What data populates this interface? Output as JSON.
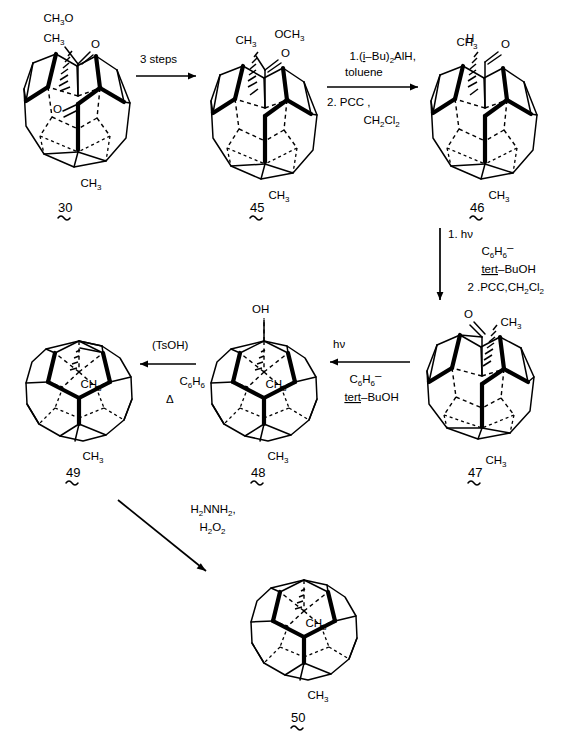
{
  "scheme": {
    "title": "Dodecahedrane synthesis reaction scheme",
    "compounds": [
      {
        "id": "30",
        "number": "30",
        "top_label_a": "CH",
        "top_label_a_sub": "3",
        "top_label_a_tail": "O",
        "top_label_b": "CH",
        "top_label_b_sub": "3",
        "carbonyl_o": "O",
        "internal_o": "O",
        "bottom_label": "CH",
        "bottom_label_sub": "3"
      },
      {
        "id": "45",
        "number": "45",
        "top_label_a": "CH",
        "top_label_a_sub": "3",
        "top_label_b": "OCH",
        "top_label_b_sub": "3",
        "carbonyl_o": "O",
        "bottom_label": "CH",
        "bottom_label_sub": "3"
      },
      {
        "id": "46",
        "number": "46",
        "top_label_a": "CH",
        "top_label_a_sub": "3",
        "top_label_h": "H",
        "carbonyl_o": "O",
        "bottom_label": "CH",
        "bottom_label_sub": "3"
      },
      {
        "id": "47",
        "number": "47",
        "carbonyl_o": "O",
        "top_label_a": "CH",
        "top_label_a_sub": "3",
        "bottom_label": "CH",
        "bottom_label_sub": "3"
      },
      {
        "id": "48",
        "number": "48",
        "top_label": "OH",
        "inner_label": "CH",
        "inner_label_sub": "3",
        "bottom_label": "CH",
        "bottom_label_sub": "3"
      },
      {
        "id": "49",
        "number": "49",
        "inner_label": "CH",
        "inner_label_sub": "3",
        "bottom_label": "CH",
        "bottom_label_sub": "3"
      },
      {
        "id": "50",
        "number": "50",
        "inner_label": "CH",
        "inner_label_sub": "3",
        "bottom_label": "CH",
        "bottom_label_sub": "3"
      }
    ],
    "arrows": [
      {
        "name": "arrow-30-to-45",
        "direction": "right",
        "above": "3 steps",
        "below": ""
      },
      {
        "name": "arrow-45-to-46",
        "direction": "right",
        "line1_a": "1.(",
        "line1_i": "i",
        "line1_b": "–Bu)",
        "line1_sub": "2",
        "line1_c": "AlH,",
        "line2": "toluene",
        "line3": "2. PCC ,",
        "line4_a": "CH",
        "line4_sub1": "2",
        "line4_b": "Cl",
        "line4_sub2": "2"
      },
      {
        "name": "arrow-46-to-47",
        "direction": "down",
        "line1": "1. hν",
        "line2_a": "C",
        "line2_sub1": "6",
        "line2_b": "H",
        "line2_sub2": "6",
        "line2_c": "–",
        "line3_a": "tert",
        "line3_b": "–BuOH",
        "line4_a": "2 .PCC,CH",
        "line4_sub1": "2",
        "line4_b": "Cl",
        "line4_sub2": "2"
      },
      {
        "name": "arrow-47-to-48",
        "direction": "left",
        "above": "hν",
        "below_a": "C",
        "below_sub1": "6",
        "below_b": "H",
        "below_sub2": "6",
        "below_c": "–",
        "below_line2_a": "tert",
        "below_line2_b": "–BuOH"
      },
      {
        "name": "arrow-48-to-49",
        "direction": "left",
        "above": "(TsOH)",
        "below_a": "C",
        "below_sub1": "6",
        "below_b": "H",
        "below_sub2": "6",
        "below_line2": "Δ"
      },
      {
        "name": "arrow-49-to-50",
        "direction": "diagonal-down-right",
        "line1_a": "H",
        "line1_sub1": "2",
        "line1_b": "NNH",
        "line1_sub2": "2",
        "line1_c": ",",
        "line2_a": "H",
        "line2_sub1": "2",
        "line2_b": "O",
        "line2_sub2": "2"
      }
    ]
  }
}
